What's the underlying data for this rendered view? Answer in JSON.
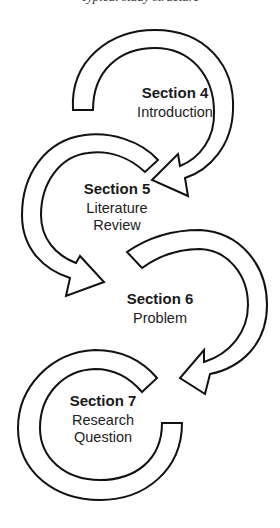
{
  "caption_clipped": "Typical study structure",
  "sections": [
    {
      "title": "Section 4",
      "subtitle": "Introduction"
    },
    {
      "title": "Section 5",
      "subtitle": "Literature Review"
    },
    {
      "title": "Section 6",
      "subtitle": "Problem"
    },
    {
      "title": "Section 7",
      "subtitle": "Research Question"
    }
  ],
  "colors": {
    "stroke": "#111111",
    "fill": "#ffffff",
    "text": "#1a1a1a"
  }
}
